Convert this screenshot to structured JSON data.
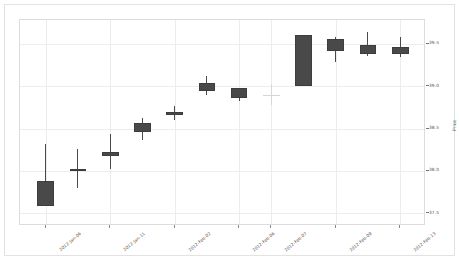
{
  "chart_data": {
    "type": "candlestick",
    "title": "",
    "xlabel": "",
    "ylabel": "Price",
    "ylim": [
      37.35,
      39.78
    ],
    "yticks": [
      37.5,
      38.0,
      38.5,
      39.0,
      39.5
    ],
    "ytick_labels": [
      "37.5",
      "38.0",
      "38.5",
      "39.0",
      "39.5"
    ],
    "grid": true,
    "legend": "none",
    "xtick_labels": [
      "2012-Jan-06",
      "2012-Jan-11",
      "2012-Feb-02",
      "2012-Feb-06",
      "2012-Feb-07",
      "2012-Feb-09",
      "2012-Feb-13"
    ],
    "xtick_positions": [
      0,
      2,
      4,
      6,
      7,
      9,
      11
    ],
    "candles": [
      {
        "index": 0,
        "label": "2012-Jan-06",
        "open": 37.88,
        "high": 38.32,
        "low": 37.58,
        "close": 37.58,
        "direction": "down"
      },
      {
        "index": 1,
        "label": "2012-Jan-09",
        "open": 38.02,
        "high": 38.26,
        "low": 37.8,
        "close": 38.0,
        "direction": "flat"
      },
      {
        "index": 2,
        "label": "2012-Jan-11",
        "open": 38.22,
        "high": 38.44,
        "low": 38.02,
        "close": 38.18,
        "direction": "down"
      },
      {
        "index": 3,
        "label": "2012-Feb-01",
        "open": 38.56,
        "high": 38.62,
        "low": 38.36,
        "close": 38.46,
        "direction": "down"
      },
      {
        "index": 4,
        "label": "2012-Feb-02",
        "open": 38.7,
        "high": 38.76,
        "low": 38.6,
        "close": 38.66,
        "direction": "down"
      },
      {
        "index": 5,
        "label": "2012-Feb-03",
        "open": 39.04,
        "high": 39.12,
        "low": 38.9,
        "close": 38.94,
        "direction": "down"
      },
      {
        "index": 6,
        "label": "2012-Feb-06",
        "open": 38.98,
        "high": 38.98,
        "low": 38.82,
        "close": 38.86,
        "direction": "down"
      },
      {
        "index": 7,
        "label": "2012-Feb-07",
        "open": 38.9,
        "high": 39.02,
        "low": 38.78,
        "close": 38.9,
        "direction": "doji"
      },
      {
        "index": 8,
        "label": "2012-Feb-08",
        "open": 39.6,
        "high": 39.6,
        "low": 39.0,
        "close": 39.0,
        "direction": "down"
      },
      {
        "index": 9,
        "label": "2012-Feb-09",
        "open": 39.56,
        "high": 39.58,
        "low": 39.28,
        "close": 39.42,
        "direction": "down"
      },
      {
        "index": 10,
        "label": "2012-Feb-12",
        "open": 39.48,
        "high": 39.64,
        "low": 39.36,
        "close": 39.38,
        "direction": "down"
      },
      {
        "index": 11,
        "label": "2012-Feb-13",
        "open": 39.46,
        "high": 39.58,
        "low": 39.34,
        "close": 39.38,
        "direction": "down"
      }
    ],
    "colors": {
      "body": "#494949",
      "wick": "#4a4a4a",
      "doji": "#d5d5d5",
      "grid": "#ececec",
      "background": "#ffffff",
      "border": "#e2e2e2",
      "tick_text": "#555555"
    }
  }
}
